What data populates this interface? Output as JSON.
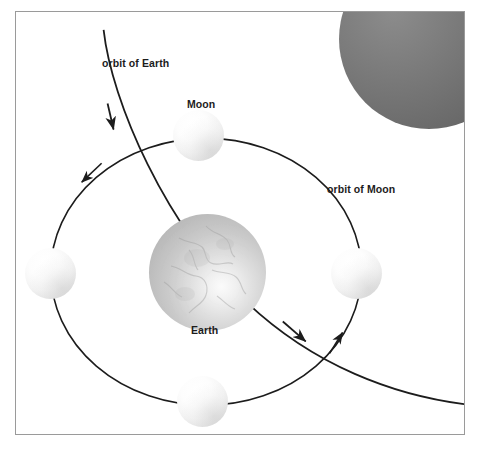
{
  "diagram": {
    "frame": {
      "border_color": "#9a9a9a",
      "background": "#ffffff"
    },
    "labels": {
      "orbit_of_earth": "orbit of Earth",
      "orbit_of_moon": "orbit of Moon",
      "moon": "Moon",
      "earth": "Earth"
    },
    "bodies": [
      {
        "name": "earth",
        "label": "Earth",
        "kind": "planet",
        "position": "center",
        "cx": 206,
        "cy": 269,
        "r": 58,
        "color": "#c9c9c9"
      },
      {
        "name": "moon-top",
        "label": "Moon",
        "kind": "moon",
        "position": "top",
        "cx": 197,
        "cy": 134,
        "r": 25,
        "color": "#fdfdfd"
      },
      {
        "name": "moon-right",
        "label": "",
        "kind": "moon",
        "position": "right",
        "cx": 355,
        "cy": 272,
        "r": 25,
        "color": "#fdfdfd"
      },
      {
        "name": "moon-bottom",
        "label": "",
        "kind": "moon",
        "position": "bottom",
        "cx": 201,
        "cy": 400,
        "r": 25,
        "color": "#fdfdfd"
      },
      {
        "name": "moon-left",
        "label": "",
        "kind": "moon",
        "position": "left",
        "cx": 50,
        "cy": 272,
        "r": 25,
        "color": "#fdfdfd"
      },
      {
        "name": "corner-body",
        "label": "",
        "kind": "sphere",
        "position": "top-right",
        "cx": 500,
        "cy": 28,
        "r": 90,
        "color": "#6f6f6f"
      }
    ],
    "orbits": [
      {
        "name": "orbit-of-moon",
        "label": "orbit of Moon",
        "shape": "ellipse",
        "center_x": 206,
        "center_y": 272,
        "radius_x": 156,
        "radius_y": 134,
        "stroke": "#1c1c1c",
        "stroke_width": 1.6,
        "direction": "counterclockwise",
        "arrow_count": 2
      },
      {
        "name": "orbit-of-earth",
        "label": "orbit of Earth",
        "shape": "arc",
        "stroke": "#1c1c1c",
        "stroke_width": 1.8,
        "direction": "down-right",
        "arrow_count": 2
      }
    ],
    "arrows": [
      {
        "name": "arrow-earth-orbit-upper",
        "on": "orbit-of-earth",
        "x": 111,
        "y": 112,
        "angle": 108
      },
      {
        "name": "arrow-earth-orbit-lower",
        "on": "orbit-of-earth",
        "x": 300,
        "y": 345,
        "angle": 33
      },
      {
        "name": "arrow-moon-orbit-left",
        "on": "orbit-of-moon",
        "x": 82,
        "y": 180,
        "angle": 218
      },
      {
        "name": "arrow-moon-orbit-right",
        "on": "orbit-of-moon",
        "x": 338,
        "y": 332,
        "angle": 300
      }
    ]
  }
}
